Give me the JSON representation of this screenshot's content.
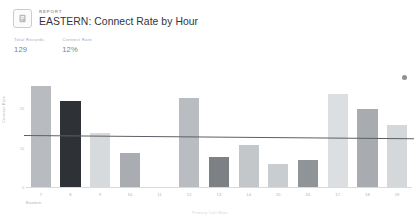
{
  "header": {
    "eyebrow": "REPORT",
    "title": "EASTERN: Connect Rate by Hour",
    "icon": "report-document-icon"
  },
  "kpis": [
    {
      "label": "Total Records",
      "value": "129"
    },
    {
      "label": "Connect Rate",
      "value": "12%"
    }
  ],
  "marker": {
    "name": "status-dot-icon",
    "color": "#8c9298"
  },
  "chart_data": {
    "type": "bar",
    "title": "EASTERN: Connect Rate by Hour",
    "xlabel": "Primary Call Hour",
    "ylabel": "Connect Rate",
    "group_label": "Eastern",
    "categories": [
      "7",
      "8",
      "9",
      "10",
      "11",
      "12",
      "13",
      "14",
      "15",
      "16",
      "17",
      "18",
      "19"
    ],
    "values": [
      26,
      22,
      14,
      9,
      0,
      23,
      8,
      11,
      6,
      7,
      24,
      20,
      16
    ],
    "ylim": [
      0,
      30
    ],
    "yticks": [
      "20",
      "10",
      "0"
    ],
    "ytick_values": [
      20,
      10,
      0
    ],
    "grid": false,
    "legend": "none",
    "bar_colors": [
      "#b8bcc0",
      "#2e3236",
      "#d7dadc",
      "#a9adb1",
      "#ffffff",
      "#b9bdc1",
      "#7d8186",
      "#c3c7ca",
      "#c9cdd0",
      "#8f9499",
      "#dcdfe1",
      "#a8acb0",
      "#d5d8da"
    ],
    "trend_line": {
      "name": "average-connect-rate-line",
      "color": "#5a6066",
      "start_value": 13.2,
      "end_value": 12.4
    }
  }
}
